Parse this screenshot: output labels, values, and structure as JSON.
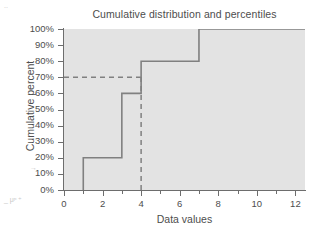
{
  "chart_data": {
    "type": "line",
    "title": "Cumulative distribution and percentiles",
    "xlabel": "Data values",
    "ylabel": "Cumulative percent",
    "xlim": [
      0,
      12.5
    ],
    "ylim": [
      0,
      100
    ],
    "grid": false,
    "legend": "none",
    "plot_background": "#e3e3e3",
    "line_color": "#808080",
    "axis_color": "#6d6d6d",
    "text_color": "#4d4d4d",
    "x_ticks": [
      0,
      2,
      4,
      6,
      8,
      10,
      12
    ],
    "x_tick_labels": [
      "0",
      "2",
      "4",
      "6",
      "8",
      "10",
      "12"
    ],
    "x_minor_ticks": [
      1,
      3,
      5,
      7,
      9,
      11
    ],
    "y_ticks": [
      0,
      10,
      20,
      30,
      40,
      50,
      60,
      70,
      80,
      90,
      100
    ],
    "y_tick_labels": [
      "0%",
      "10%",
      "20%",
      "30%",
      "40%",
      "50%",
      "60%",
      "70%",
      "80%",
      "90%",
      "100%"
    ],
    "series": [
      {
        "name": "Cumulative distribution",
        "style": "step",
        "x": [
          1,
          1,
          3,
          3,
          4,
          4,
          7,
          7,
          12.5
        ],
        "y": [
          0,
          20,
          20,
          60,
          60,
          80,
          80,
          100,
          100
        ]
      }
    ],
    "annotations": [
      {
        "name": "percentile-horizontal-guide",
        "style": "dashed",
        "from": [
          0,
          70
        ],
        "to": [
          4,
          70
        ],
        "value": "70%"
      },
      {
        "name": "percentile-vertical-guide",
        "style": "dashed",
        "from": [
          4,
          0
        ],
        "to": [
          4,
          70
        ],
        "value": "4"
      }
    ],
    "steps": [
      {
        "data_value": 1,
        "cumulative_percent": 20
      },
      {
        "data_value": 3,
        "cumulative_percent": 60
      },
      {
        "data_value": 4,
        "cumulative_percent": 80
      },
      {
        "data_value": 7,
        "cumulative_percent": 100
      }
    ]
  },
  "artifacts": {
    "top_left": "..",
    "mid_left": "→",
    "bottom_left": "_ μᵖ ⁺"
  }
}
